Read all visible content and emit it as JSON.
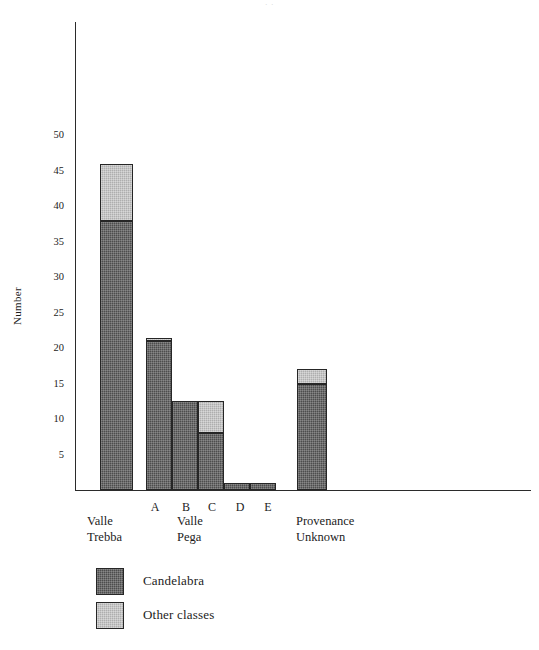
{
  "figure": {
    "title_remnant": "·        ·",
    "ylabel": "Number"
  },
  "axis": {
    "y_ticks": [
      {
        "label": "50",
        "value": 50
      },
      {
        "label": "45",
        "value": 45
      },
      {
        "label": "40",
        "value": 40
      },
      {
        "label": "35",
        "value": 35
      },
      {
        "label": "30",
        "value": 30
      },
      {
        "label": "25",
        "value": 25
      },
      {
        "label": "20",
        "value": 20
      },
      {
        "label": "15",
        "value": 15
      },
      {
        "label": "10",
        "value": 10
      },
      {
        "label": "5",
        "value": 5
      }
    ],
    "ymin": 0,
    "ymax": 66
  },
  "groups": [
    {
      "name": "Valle Trebba",
      "line1": "Valle",
      "line2": "Trebba"
    },
    {
      "name": "Valle Pega",
      "line1": "Valle",
      "line2": "Pega"
    },
    {
      "name": "Provenance Unknown",
      "line1": "Provenance",
      "line2": "Unknown"
    }
  ],
  "sublabels": [
    {
      "label": "A"
    },
    {
      "label": "B"
    },
    {
      "label": "C"
    },
    {
      "label": "D"
    },
    {
      "label": "E"
    }
  ],
  "legend": {
    "entries": [
      {
        "label": "Candelabra",
        "color": "#4d4d4d",
        "swatch": "dark"
      },
      {
        "label": "Other classes",
        "color": "#aeaeae",
        "swatch": "light"
      }
    ]
  },
  "colors": {
    "candelabra": "#4d4d4d",
    "other_classes": "#aeaeae",
    "axis": "#2b2b2b",
    "text": "#1c1c1c",
    "background": "#ffffff"
  },
  "chart_data": {
    "type": "bar",
    "stacked": true,
    "title": "",
    "xlabel": "",
    "ylabel": "Number",
    "ylim": [
      0,
      66
    ],
    "ytick_step": 5,
    "grid": false,
    "legend_position": "bottom-left",
    "categories": [
      "Valle Trebba",
      "Valle Pega A",
      "Valle Pega B",
      "Valle Pega C",
      "Valle Pega D",
      "Valle Pega E",
      "Provenance Unknown"
    ],
    "series": [
      {
        "name": "Candelabra",
        "color": "#4d4d4d",
        "values": [
          38,
          21,
          12.5,
          8,
          1,
          1,
          15
        ]
      },
      {
        "name": "Other classes",
        "color": "#aeaeae",
        "values": [
          8,
          0.5,
          0,
          4.5,
          0,
          0,
          2
        ]
      }
    ],
    "totals": [
      46,
      21.5,
      12.5,
      12.5,
      1,
      1,
      17
    ]
  },
  "bars": [
    {
      "name": "valle-trebba",
      "x": 25,
      "width": 33,
      "dark": 38,
      "light": 8
    },
    {
      "name": "pega-a",
      "x": 71,
      "width": 26,
      "dark": 21,
      "light": 0.5
    },
    {
      "name": "pega-b",
      "x": 97,
      "width": 26,
      "dark": 12.5,
      "light": 0
    },
    {
      "name": "pega-c",
      "x": 123,
      "width": 26,
      "dark": 8,
      "light": 4.5
    },
    {
      "name": "pega-d",
      "x": 149,
      "width": 26,
      "dark": 1,
      "light": 0
    },
    {
      "name": "pega-e",
      "x": 175,
      "width": 26,
      "dark": 1,
      "light": 0
    },
    {
      "name": "provenance-unknown",
      "x": 222,
      "width": 30,
      "dark": 15,
      "light": 2
    }
  ],
  "sublabel_positions": [
    155,
    186,
    212,
    240,
    268
  ],
  "group_positions": [
    87,
    177,
    296
  ]
}
